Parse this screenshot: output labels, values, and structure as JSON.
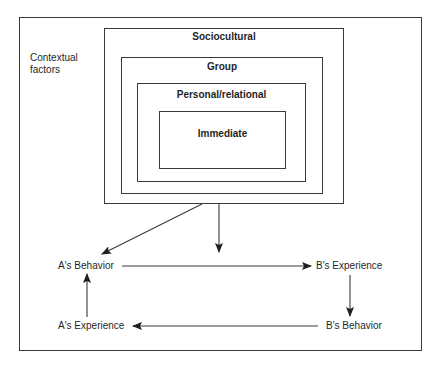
{
  "diagram": {
    "contextual_label": [
      "Contextual",
      "factors"
    ],
    "levels": [
      {
        "id": "sociocultural",
        "label": "Sociocultural"
      },
      {
        "id": "group",
        "label": "Group"
      },
      {
        "id": "personal",
        "label": "Personal/relational"
      },
      {
        "id": "immediate",
        "label": "Immediate"
      }
    ],
    "nodes": {
      "a_behavior": "A's Behavior",
      "b_experience": "B's Experience",
      "b_behavior": "B's Behavior",
      "a_experience": "A's Experience"
    },
    "edges": [
      {
        "from": "sociocultural",
        "to": "a_behavior"
      },
      {
        "from": "sociocultural",
        "to": "interaction"
      },
      {
        "from": "a_behavior",
        "to": "b_experience"
      },
      {
        "from": "b_experience",
        "to": "b_behavior"
      },
      {
        "from": "b_behavior",
        "to": "a_experience"
      },
      {
        "from": "a_experience",
        "to": "a_behavior"
      }
    ],
    "colors": {
      "line": "#3a3a3a",
      "background": "#ffffff"
    }
  }
}
